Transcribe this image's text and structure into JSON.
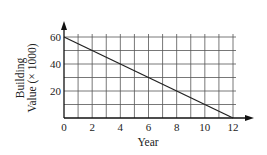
{
  "chart_data": {
    "type": "line",
    "title": "",
    "xlabel": "Year",
    "ylabel_line1": "Building",
    "ylabel_line2": "Value (× 1000)",
    "x_ticks": [
      0,
      2,
      4,
      6,
      8,
      10,
      12
    ],
    "y_ticks": [
      20,
      40,
      60
    ],
    "xlim": [
      0,
      12
    ],
    "ylim": [
      0,
      60
    ],
    "grid": true,
    "grid_x_step": 1,
    "grid_y_step": 10,
    "legend": null,
    "series": [
      {
        "name": "Building Value",
        "x": [
          0,
          12
        ],
        "y": [
          60,
          0
        ],
        "color": "#222222"
      }
    ]
  },
  "labels": {
    "xlabel": "Year",
    "ylabel_line1": "Building",
    "ylabel_line2": "Value (× 1000)"
  },
  "colors": {
    "axis": "#111111",
    "grid": "#555555",
    "line": "#222222"
  }
}
